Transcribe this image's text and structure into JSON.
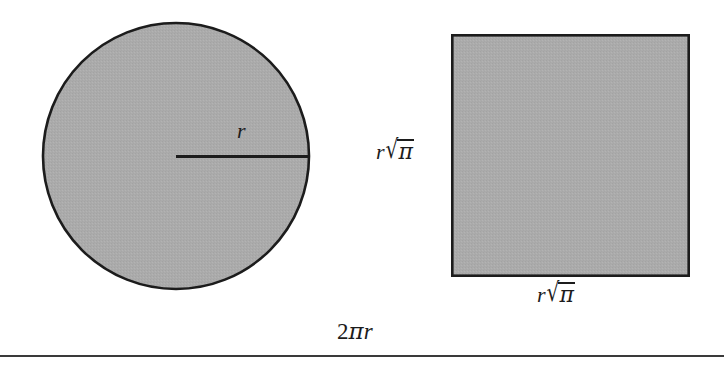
{
  "figure": {
    "background_color": "#ffffff",
    "fill_color": "#ababab",
    "stroke_color": "#1c1c1c"
  },
  "circle": {
    "center_x": 176,
    "center_y": 156,
    "radius": 134,
    "fill": "#ababab",
    "stroke": "#1c1c1c",
    "stroke_width": 2.6,
    "radius_line": {
      "x1": 176,
      "y1": 156,
      "x2": 310,
      "y2": 156,
      "stroke_width": 3
    },
    "radius_label": {
      "variable": "r"
    }
  },
  "square": {
    "x": 451,
    "y": 34,
    "width": 239,
    "height": 243,
    "fill": "#ababab",
    "stroke": "#1c1c1c",
    "stroke_width": 2.6,
    "side_label_left": {
      "variable": "r",
      "radical_symbol": "√",
      "radicand": "π"
    },
    "side_label_bottom": {
      "variable": "r",
      "radical_symbol": "√",
      "radicand": "π"
    }
  },
  "circumference_label": {
    "coefficient": "2",
    "greek": "π",
    "variable": "r"
  },
  "rule": {
    "x1": 0,
    "y1": 356,
    "x2": 724,
    "y2": 356,
    "stroke": "#3a3a3a",
    "stroke_width": 2
  }
}
